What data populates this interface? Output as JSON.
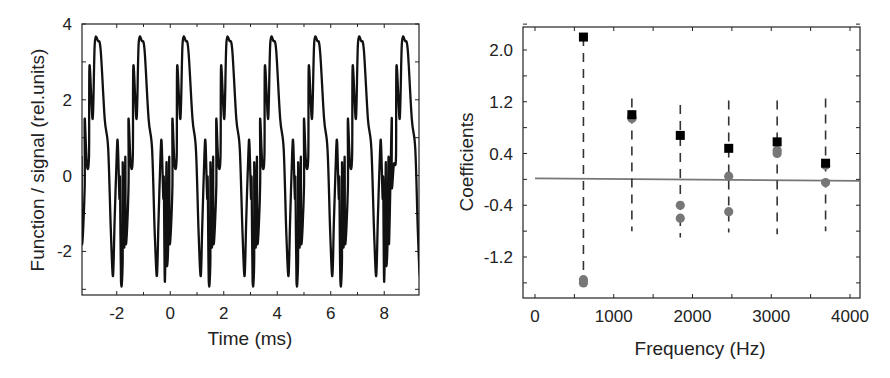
{
  "chart_data": [
    {
      "type": "line",
      "title": "",
      "xlabel": "Time (ms)",
      "ylabel": "Function / signal (rel.units)",
      "xlim": [
        -3.3,
        9.3
      ],
      "ylim": [
        -3.15,
        4
      ],
      "xticks": [
        -2,
        0,
        2,
        4,
        6,
        8
      ],
      "yticks": [
        -2,
        0,
        2,
        4
      ],
      "grid": false,
      "legend": null,
      "series": [
        {
          "name": "signal",
          "color": "#111111",
          "description": "Periodic waveform, period ~1.64 ms (fundamental ~610 Hz), peaks ~3.55, secondary peak ~0.85, troughs ~-2.65 and ~-2.8",
          "period_ms": 1.64,
          "harmonics": [
            {
              "n": 1,
              "a": 2.2,
              "b": -1.5
            },
            {
              "n": 2,
              "a": 1.0,
              "b": -0.4
            },
            {
              "n": 3,
              "a": 0.7,
              "b": -0.5
            },
            {
              "n": 4,
              "a": 0.5,
              "b": 0.05
            },
            {
              "n": 5,
              "a": 0.55,
              "b": 0.4
            },
            {
              "n": 6,
              "a": 0.25,
              "b": -0.05
            }
          ],
          "peak_times_ms": [
            -2.7,
            -1.06,
            0.58,
            2.22,
            3.86,
            5.5,
            7.14,
            8.78
          ],
          "peak_value": 3.55,
          "secondary_peak_value": 0.85,
          "trough_values": [
            -2.65,
            -2.8
          ]
        }
      ]
    },
    {
      "type": "scatter",
      "title": "",
      "xlabel": "Frequency (Hz)",
      "ylabel": "Coefficients",
      "xlim": [
        -150,
        4100
      ],
      "ylim": [
        -1.75,
        2.45
      ],
      "xticks": [
        0,
        1000,
        2000,
        3000,
        4000
      ],
      "yticks": [
        -1.2,
        -0.4,
        0.4,
        1.2,
        2.0
      ],
      "ytick_labels": [
        "-1.2",
        "-0.4",
        "0.4",
        "1.2",
        "2.0"
      ],
      "grid": false,
      "legend": null,
      "zero_line": {
        "y": 0.0,
        "color": "#777777"
      },
      "x": [
        615,
        1230,
        1845,
        2460,
        3075,
        3690
      ],
      "series": [
        {
          "name": "amplitude",
          "marker": "square",
          "color": "#000000",
          "values": [
            2.2,
            1.0,
            0.68,
            0.48,
            0.58,
            0.25
          ]
        },
        {
          "name": "coefficient a",
          "marker": "circle",
          "color": "#777777",
          "values": [
            -1.55,
            0.94,
            -0.4,
            0.05,
            0.4,
            0.22
          ]
        },
        {
          "name": "coefficient b",
          "marker": "circle",
          "color": "#777777",
          "values": [
            -1.6,
            0.97,
            -0.6,
            -0.5,
            0.45,
            -0.05
          ]
        }
      ],
      "error_bars": {
        "style": "dashed vertical",
        "ranges": [
          [
            -1.55,
            2.2
          ],
          [
            -0.8,
            1.25
          ],
          [
            -0.9,
            1.15
          ],
          [
            -0.82,
            1.22
          ],
          [
            -0.85,
            1.22
          ],
          [
            -0.8,
            1.25
          ]
        ]
      }
    }
  ]
}
